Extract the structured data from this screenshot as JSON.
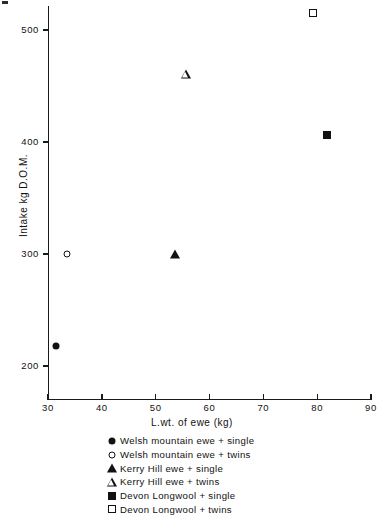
{
  "chart_data": {
    "type": "scatter",
    "title": "",
    "xlabel": "L.wt. of ewe (kg)",
    "ylabel": "Intake kg D.O.M.",
    "xlim": [
      30,
      90
    ],
    "ylim": [
      170,
      530
    ],
    "xticks": [
      30,
      40,
      50,
      60,
      70,
      80,
      90
    ],
    "yticks": [
      200,
      300,
      400,
      500
    ],
    "xtick_labels": [
      "30",
      "40",
      "50",
      "60",
      "70",
      "80",
      "90"
    ],
    "ytick_labels": [
      "200",
      "300",
      "400",
      "500"
    ],
    "grid": false,
    "legend_position": "below-axes",
    "series": [
      {
        "name": "Welsh mountain ewe + single",
        "marker": "filled-circle",
        "marker_class": "m-filled-circle",
        "color": "#121212",
        "points": [
          {
            "x": 31.5,
            "y": 218
          }
        ]
      },
      {
        "name": "Welsh mountain ewe + twins",
        "marker": "open-circle",
        "marker_class": "m-open-circle",
        "color": "#121212",
        "points": [
          {
            "x": 33.5,
            "y": 300
          }
        ]
      },
      {
        "name": "Kerry Hill ewe + single",
        "marker": "filled-triangle",
        "marker_class": "m-filled-triangle",
        "color": "#121212",
        "points": [
          {
            "x": 53.6,
            "y": 300
          }
        ]
      },
      {
        "name": "Kerry Hill ewe + twins",
        "marker": "open-triangle",
        "marker_class": "m-open-triangle",
        "color": "#121212",
        "points": [
          {
            "x": 55.6,
            "y": 461
          }
        ]
      },
      {
        "name": "Devon Longwool + single",
        "marker": "filled-square",
        "marker_class": "m-filled-square",
        "color": "#121212",
        "points": [
          {
            "x": 81.8,
            "y": 406
          }
        ]
      },
      {
        "name": "Devon Longwool + twins",
        "marker": "open-square",
        "marker_class": "m-open-square",
        "color": "#121212",
        "points": [
          {
            "x": 79.2,
            "y": 515
          }
        ]
      }
    ]
  },
  "legend": {
    "entries": [
      {
        "label": "Welsh mountain ewe + single",
        "marker_class": "m-filled-circle"
      },
      {
        "label": "Welsh mountain ewe + twins",
        "marker_class": "m-open-circle"
      },
      {
        "label": "Kerry Hill ewe + single",
        "marker_class": "m-filled-triangle"
      },
      {
        "label": "Kerry Hill ewe + twins",
        "marker_class": "m-open-triangle"
      },
      {
        "label": "Devon Longwool + single",
        "marker_class": "m-filled-square"
      },
      {
        "label": "Devon Longwool + twins",
        "marker_class": "m-open-square"
      }
    ]
  },
  "colors": {
    "ink": "#121212",
    "axis": "#1a1a1a",
    "background": "#ffffff"
  }
}
